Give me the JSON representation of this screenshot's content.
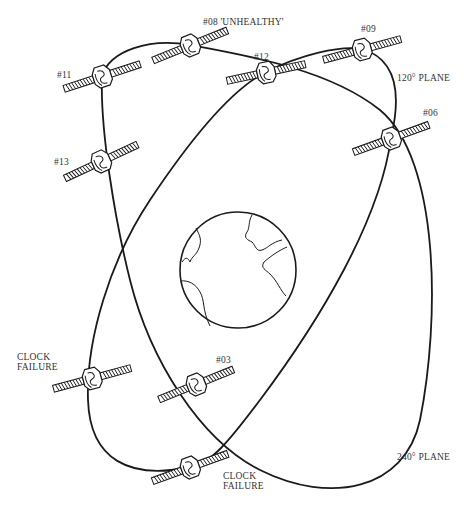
{
  "diagram": {
    "earth": {
      "label": "Earth",
      "cx": 238,
      "cy": 270,
      "r": 58
    },
    "planes": [
      {
        "id": "plane-120",
        "label": "120° PLANE"
      },
      {
        "id": "plane-240",
        "label": "240° PLANE"
      }
    ],
    "satellites": [
      {
        "id": "sat-08",
        "label": "#08 'UNHEALTHY'",
        "x": 190,
        "y": 45,
        "angle": -22,
        "status": "unhealthy"
      },
      {
        "id": "sat-11",
        "label": "#11",
        "x": 102,
        "y": 76,
        "angle": -18,
        "status": "ok"
      },
      {
        "id": "sat-13",
        "label": "#13",
        "x": 101,
        "y": 161,
        "angle": -25,
        "status": "ok"
      },
      {
        "id": "sat-12",
        "label": "#12",
        "x": 266,
        "y": 72,
        "angle": -12,
        "status": "ok"
      },
      {
        "id": "sat-09",
        "label": "#09",
        "x": 362,
        "y": 49,
        "angle": -15,
        "status": "ok"
      },
      {
        "id": "sat-06",
        "label": "#06",
        "x": 391,
        "y": 138,
        "angle": -20,
        "status": "ok"
      },
      {
        "id": "sat-clock-left",
        "label": "CLOCK FAILURE",
        "x": 92,
        "y": 378,
        "angle": -15,
        "status": "clock-failure"
      },
      {
        "id": "sat-03",
        "label": "#03",
        "x": 196,
        "y": 384,
        "angle": -22,
        "status": "ok"
      },
      {
        "id": "sat-clock-bottom",
        "label": "CLOCK FAILURE",
        "x": 190,
        "y": 467,
        "angle": -20,
        "status": "clock-failure"
      }
    ]
  },
  "labels": {
    "sat08": "#08 'UNHEALTHY'",
    "sat11": "#11",
    "sat13": "#13",
    "sat12": "#12",
    "sat09": "#09",
    "sat06": "#06",
    "sat03": "#03",
    "clock_left_1": "CLOCK",
    "clock_left_2": "FAILURE",
    "clock_bottom_1": "CLOCK",
    "clock_bottom_2": "FAILURE",
    "plane120": "120° PLANE",
    "plane240": "240° PLANE"
  }
}
